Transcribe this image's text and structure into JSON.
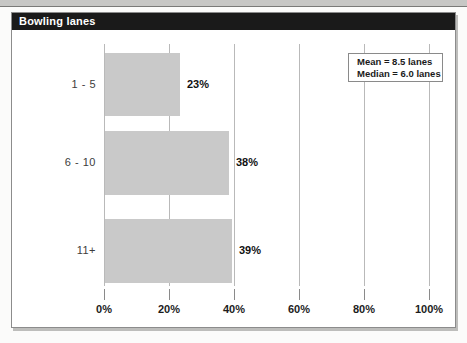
{
  "title_bar": {
    "title": "Bowling lanes"
  },
  "chart_data": {
    "type": "bar",
    "orientation": "horizontal",
    "title": "Bowling lanes",
    "categories": [
      "1 - 5",
      "6 - 10",
      "11+"
    ],
    "values": [
      23,
      38,
      39
    ],
    "value_labels": [
      "23%",
      "38%",
      "39%"
    ],
    "x_ticks": [
      "0%",
      "20%",
      "40%",
      "60%",
      "80%",
      "100%"
    ],
    "xlim": [
      0,
      100
    ],
    "grid": true,
    "legend_position": "top-right",
    "annotations": [
      "Mean = 8.5 lanes",
      "Median = 6.0 lanes"
    ],
    "colors": {
      "bar_fill": "#c9c9c9",
      "title_bar": "#1a1a1a",
      "gridline": "#b9b9b9",
      "plot_background": "#ffffff"
    }
  },
  "legend": {
    "mean": "Mean = 8.5 lanes",
    "median": "Median = 6.0 lanes"
  }
}
